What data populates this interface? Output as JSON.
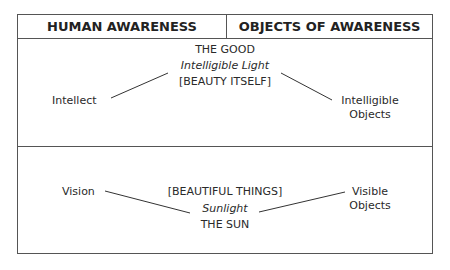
{
  "header": {
    "left": "HUMAN AWARENESS",
    "right": "OBJECTS OF AWARENESS"
  },
  "intelligible": {
    "top": "THE GOOD",
    "light": "Intelligible Light",
    "beauty": "[BEAUTY ITSELF]",
    "awareness": "Intellect",
    "object_line1": "Intelligible",
    "object_line2": "Objects"
  },
  "visible": {
    "beauty": "[BEAUTIFUL THINGS]",
    "light": "Sunlight",
    "source": "THE SUN",
    "awareness": "Vision",
    "object_line1": "Visible",
    "object_line2": "Objects"
  }
}
